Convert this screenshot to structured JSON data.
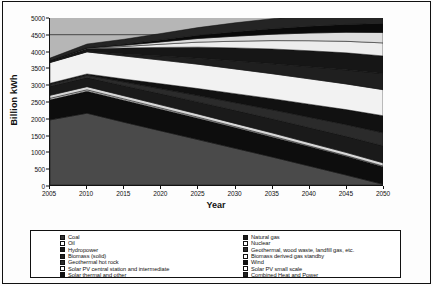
{
  "chart_data": {
    "type": "area",
    "title": "",
    "xlabel": "Year",
    "ylabel": "Billion kWh",
    "xlim": [
      2005,
      2050
    ],
    "ylim": [
      0,
      5000
    ],
    "ytick_labels": [
      "0",
      "500",
      "1000",
      "1500",
      "2000",
      "2500",
      "3000",
      "3500",
      "4000",
      "4500",
      "5000"
    ],
    "ytick_values": [
      0,
      500,
      1000,
      1500,
      2000,
      2500,
      3000,
      3500,
      4000,
      4500,
      5000
    ],
    "xtick_labels": [
      "2005",
      "2010",
      "2015",
      "2020",
      "2025",
      "2030",
      "2035",
      "2040",
      "2045",
      "2050"
    ],
    "xtick_values": [
      2005,
      2010,
      2015,
      2020,
      2025,
      2030,
      2035,
      2040,
      2045,
      2050
    ],
    "grid": true,
    "gridlines_y": [
      4500
    ],
    "legend_position": "bottom",
    "stacked": true,
    "x": [
      2005,
      2010,
      2015,
      2020,
      2025,
      2030,
      2035,
      2040,
      2045,
      2050
    ],
    "series": [
      {
        "name": "Coal",
        "fill": "#4a4a4a",
        "pattern": "solid",
        "values": [
          1950,
          2150,
          1880,
          1620,
          1360,
          1100,
          840,
          570,
          300,
          20
        ]
      },
      {
        "name": "Natural gas",
        "fill": "#0d0d0d",
        "pattern": "solid",
        "values": [
          600,
          660,
          660,
          650,
          640,
          620,
          600,
          580,
          560,
          530
        ]
      },
      {
        "name": "Oil",
        "fill": "#e8e8e8",
        "pattern": "open",
        "values": [
          45,
          40,
          38,
          35,
          32,
          30,
          28,
          25,
          22,
          20
        ]
      },
      {
        "name": "Nuclear",
        "fill": "#d8d8d8",
        "pattern": "open",
        "values": [
          90,
          95,
          95,
          95,
          95,
          95,
          95,
          95,
          95,
          95
        ]
      },
      {
        "name": "Hydropower",
        "fill": "#1a1a1a",
        "pattern": "solid",
        "values": [
          270,
          270,
          300,
          330,
          360,
          390,
          420,
          450,
          480,
          510
        ]
      },
      {
        "name": "Geothermal, wood waste, landfill gas, etc.",
        "fill": "#2b2b2b",
        "pattern": "solid",
        "values": [
          60,
          70,
          110,
          150,
          190,
          230,
          270,
          310,
          350,
          390
        ]
      },
      {
        "name": "Biomass (solid)",
        "fill": "#111111",
        "pattern": "solid",
        "values": [
          30,
          40,
          90,
          150,
          210,
          270,
          330,
          390,
          450,
          510
        ]
      },
      {
        "name": "Biomass derived gas standby",
        "fill": "#f2f2f2",
        "pattern": "open",
        "values": [
          620,
          660,
          690,
          710,
          730,
          740,
          750,
          760,
          770,
          780
        ]
      },
      {
        "name": "Geothermal hot rock",
        "fill": "#1f1f1f",
        "pattern": "solid",
        "values": [
          10,
          15,
          60,
          120,
          180,
          240,
          300,
          360,
          420,
          480
        ]
      },
      {
        "name": "Wind",
        "fill": "#161616",
        "pattern": "solid",
        "values": [
          30,
          80,
          180,
          260,
          330,
          390,
          440,
          480,
          510,
          530
        ]
      },
      {
        "name": "Solar PV central station and intermediate",
        "fill": "#ededed",
        "pattern": "open",
        "values": [
          5,
          10,
          45,
          95,
          150,
          200,
          250,
          300,
          345,
          390
        ]
      },
      {
        "name": "Solar PV small scale",
        "fill": "#dedede",
        "pattern": "open",
        "values": [
          5,
          10,
          35,
          70,
          110,
          150,
          190,
          230,
          270,
          310
        ]
      },
      {
        "name": "Solar thermal and other",
        "fill": "#0a0a0a",
        "pattern": "solid",
        "values": [
          5,
          10,
          30,
          60,
          95,
          130,
          165,
          200,
          235,
          270
        ]
      },
      {
        "name": "Combined Heat and Power",
        "fill": "#242424",
        "pattern": "solid",
        "values": [
          80,
          110,
          150,
          190,
          230,
          270,
          300,
          330,
          350,
          370
        ]
      }
    ],
    "legend_columns": [
      [
        "Coal",
        "Oil",
        "Hydropower",
        "Biomass (solid)",
        "Geothermal hot rock",
        "Solar PV central station and intermediate",
        "Solar thermal and other"
      ],
      [
        "Natural gas",
        "Nuclear",
        "Geothermal, wood waste, landfill gas, etc.",
        "Biomass derived gas standby",
        "Wind",
        "Solar PV small scale",
        "Combined Heat and Power"
      ]
    ],
    "legend_swatches": [
      [
        "#333333",
        "#ffffff",
        "#1a1a1a",
        "#222222",
        "#2b2b2b",
        "#ffffff",
        "#111111"
      ],
      [
        "#1a1a1a",
        "#ffffff",
        "#2b2b2b",
        "#ffffff",
        "#111111",
        "#ffffff",
        "#222222"
      ]
    ],
    "plot_background": "#b6b6b6",
    "axis_color": "#111111"
  }
}
